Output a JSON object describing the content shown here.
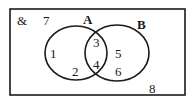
{
  "diagram": {
    "type": "venn",
    "universal_symbol": "&",
    "sets": [
      {
        "name": "A",
        "label": "A"
      },
      {
        "name": "B",
        "label": "B"
      }
    ],
    "regions": {
      "only_A": [
        "1",
        "2"
      ],
      "A_and_B": [
        "3",
        "4"
      ],
      "only_B": [
        "5",
        "6"
      ],
      "outside": [
        "7",
        "8"
      ]
    },
    "labels": {
      "u": "&",
      "n7": "7",
      "A": "A",
      "B": "B",
      "n1": "1",
      "n2": "2",
      "n3": "3",
      "n4": "4",
      "n5": "5",
      "n6": "6",
      "n8": "8"
    },
    "colors": {
      "stroke": "#1a1a1a",
      "background": "#ffffff"
    }
  }
}
